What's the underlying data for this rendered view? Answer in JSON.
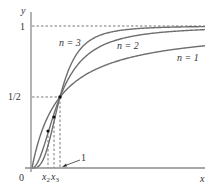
{
  "chart_data": {
    "type": "line",
    "title": "",
    "xlabel": "x",
    "ylabel": "y",
    "function": "f_n(x) = x^n / (1 + x^n)",
    "xlim": [
      0,
      6.2
    ],
    "ylim": [
      0,
      1.05
    ],
    "grid": false,
    "legend": "inline labels",
    "y_ticks": [
      {
        "value": 0.5,
        "label": "1/2"
      },
      {
        "value": 1,
        "label": "1"
      }
    ],
    "x_ticks": [
      {
        "value": 0,
        "label": "0"
      },
      {
        "value": 0.57,
        "label": "x2"
      },
      {
        "value": 0.79,
        "label": "x3"
      },
      {
        "value": 1,
        "label": "1"
      }
    ],
    "series": [
      {
        "name": "n = 1",
        "x": [
          0,
          0.5,
          1,
          2,
          3,
          4,
          5,
          6.18
        ],
        "values": [
          0,
          0.333,
          0.5,
          0.667,
          0.75,
          0.8,
          0.833,
          0.861
        ]
      },
      {
        "name": "n = 2",
        "x": [
          0,
          0.5,
          1,
          2,
          3,
          4,
          5,
          6.18
        ],
        "values": [
          0,
          0.2,
          0.5,
          0.8,
          0.9,
          0.941,
          0.962,
          0.974
        ]
      },
      {
        "name": "n = 3",
        "x": [
          0,
          0.5,
          1,
          2,
          3,
          4,
          5,
          6.18
        ],
        "values": [
          0,
          0.111,
          0.5,
          0.889,
          0.964,
          0.985,
          0.992,
          0.996
        ]
      }
    ],
    "annotations": [
      {
        "text": "n = 3",
        "position": "upper-left near curve"
      },
      {
        "text": "n = 2",
        "position": "middle near curve"
      },
      {
        "text": "n = 1",
        "position": "right near curve"
      },
      {
        "text": "1",
        "type": "arrow pointing to x = 1"
      },
      {
        "text": "asymptote y = 1",
        "type": "dashed horizontal line"
      },
      {
        "text": "common point (1, 1/2)",
        "type": "marked dot"
      },
      {
        "text": "points at x2 and x3",
        "type": "marked dots with dashed drop lines"
      }
    ]
  },
  "labels": {
    "y_axis": "y",
    "x_axis": "x",
    "y_one": "1",
    "y_half": "1/2",
    "origin": "0",
    "x2_main": "x",
    "x2_sub": "2",
    "x3_main": "x",
    "x3_sub": "3",
    "one_pointer": "1",
    "n3": "n = 3",
    "n2": "n = 2",
    "n1": "n = 1"
  }
}
